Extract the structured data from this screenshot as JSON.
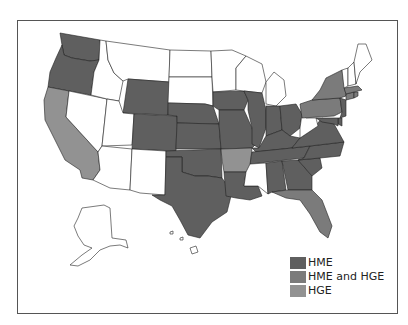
{
  "map": {
    "title": "",
    "categories": {
      "hme": {
        "label": "HME",
        "color": "#5f5f5f"
      },
      "both": {
        "label": "HME and HGE",
        "color": "#7b7b7b"
      },
      "hge": {
        "label": "HGE",
        "color": "#929292"
      },
      "none": {
        "label": "",
        "color": "#ffffff"
      }
    },
    "states": {
      "WA": "hme",
      "OR": "hme",
      "CA": "hge",
      "NV": "none",
      "ID": "none",
      "MT": "none",
      "WY": "hme",
      "UT": "none",
      "CO": "hme",
      "AZ": "none",
      "NM": "none",
      "ND": "none",
      "SD": "none",
      "NE": "hme",
      "KS": "hme",
      "OK": "hme",
      "TX": "hme",
      "MN": "none",
      "IA": "hme",
      "MO": "hme",
      "AR": "hge",
      "LA": "hme",
      "WI": "none",
      "IL": "hme",
      "MI": "none",
      "IN": "hme",
      "OH": "hme",
      "KY": "hme",
      "TN": "hme",
      "MS": "none",
      "AL": "hme",
      "GA": "hme",
      "FL": "both",
      "SC": "hme",
      "NC": "hme",
      "VA": "hme",
      "WV": "none",
      "PA": "both",
      "NY": "both",
      "NJ": "hme",
      "DE": "hme",
      "MD": "hme",
      "CT": "both",
      "RI": "both",
      "MA": "both",
      "VT": "none",
      "NH": "none",
      "ME": "none",
      "AK": "none",
      "HI": "none"
    }
  },
  "legend": {
    "items": [
      {
        "label": "HME",
        "color": "#5f5f5f"
      },
      {
        "label": "HME and HGE",
        "color": "#7b7b7b"
      },
      {
        "label": "HGE",
        "color": "#929292"
      }
    ]
  }
}
